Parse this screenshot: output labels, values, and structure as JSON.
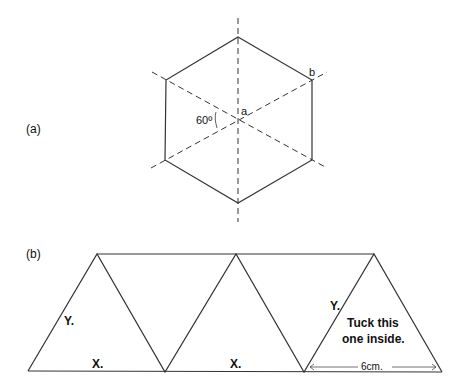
{
  "figure_a": {
    "label": "(a)",
    "angle_label": "60º",
    "point_a": "a",
    "point_b": "b"
  },
  "figure_b": {
    "label": "(b)",
    "edge_y1": "Y.",
    "edge_x1": "X.",
    "edge_x2": "X.",
    "edge_y2": "Y.",
    "tuck_line1": "Tuck this",
    "tuck_line2": "one inside.",
    "dimension": "6cm."
  },
  "colors": {
    "line": "#333333",
    "text": "#111111"
  }
}
